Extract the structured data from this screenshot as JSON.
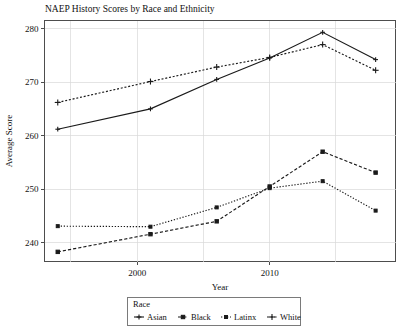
{
  "chart_data": {
    "type": "line",
    "title": "NAEP History Scores by Race and Ethnicity",
    "xlabel": "Year",
    "ylabel": "Average Score",
    "xlim": [
      1993,
      2019.5
    ],
    "ylim": [
      236.5,
      281.5
    ],
    "grid": true,
    "x_ticks": [
      2000,
      2010
    ],
    "x_tick_labels": [
      "2000",
      "2010"
    ],
    "x_gridlines": [
      1995,
      2000,
      2005,
      2010,
      2015
    ],
    "y_ticks": [
      240,
      250,
      260,
      270,
      280
    ],
    "y_tick_labels": [
      "240",
      "250",
      "260",
      "270",
      "280"
    ],
    "legend": {
      "title": "Race",
      "position": "bottom",
      "entries": [
        "Asian",
        "Black",
        "Latinx",
        "White"
      ]
    },
    "x": [
      1994,
      2001,
      2006,
      2010,
      2014,
      2018
    ],
    "series": [
      {
        "name": "Asian",
        "linestyle": "solid",
        "marker": "plus-small",
        "color": "#1a1a1a",
        "values": [
          261.2,
          265.0,
          270.5,
          274.5,
          279.3,
          274.2
        ]
      },
      {
        "name": "Black",
        "linestyle": "dashed",
        "marker": "square",
        "color": "#1a1a1a",
        "values": [
          238.3,
          241.6,
          244.0,
          250.5,
          257.0,
          253.1
        ]
      },
      {
        "name": "Latinx",
        "linestyle": "dotted",
        "marker": "square-small",
        "color": "#1a1a1a",
        "values": [
          243.1,
          243.0,
          246.6,
          250.2,
          251.5,
          246.0
        ]
      },
      {
        "name": "White",
        "linestyle": "dotted-plus",
        "marker": "plus",
        "color": "#1a1a1a",
        "values": [
          266.2,
          270.1,
          272.8,
          274.6,
          277.0,
          272.2
        ]
      }
    ]
  }
}
